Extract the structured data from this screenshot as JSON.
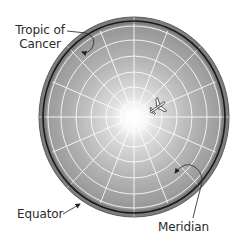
{
  "diagram": {
    "type": "polar-projection-globe",
    "labels": {
      "tropic_of_cancer_line1": "Tropic of",
      "tropic_of_cancer_line2": "Cancer",
      "equator": "Equator",
      "meridian": "Meridian"
    },
    "icons": {
      "airplane": "airplane-icon"
    },
    "colors": {
      "background": "#ffffff",
      "globe_center": "#ffffff",
      "globe_mid": "#b9b9b9",
      "globe_edge": "#8a8a8a",
      "rim_band": "#7d7d7d",
      "equator_line": "#1a1a1a",
      "grid_lines": "#ffffff",
      "label_text": "#2b2b2b",
      "leader_lines": "#333333"
    },
    "geometry": {
      "center_x": 134,
      "center_y": 117,
      "rx": 95,
      "ry": 100,
      "latitude_rings": 6,
      "meridian_count": 16
    }
  }
}
